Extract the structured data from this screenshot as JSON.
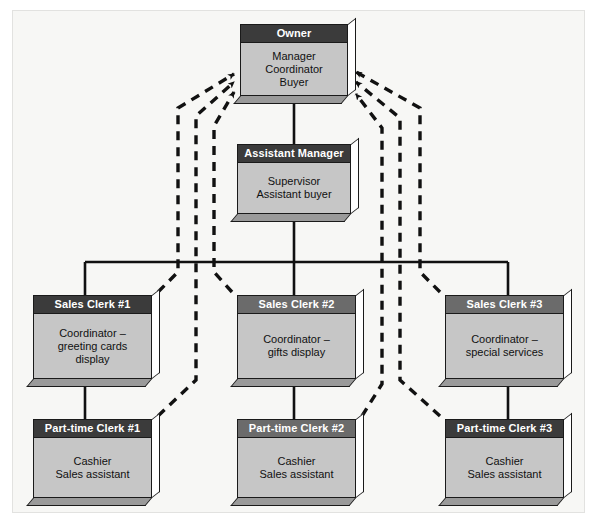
{
  "diagram": {
    "type": "organizational-chart",
    "solid_line_meaning": "direct reporting line",
    "dashed_line_meaning": "dashed arrows pointing to Owner",
    "colors": {
      "page_background": "#ffffff",
      "frame_background": "#f7f7f5",
      "frame_border": "#e2e2e0",
      "box_fill": "#c6c6c6",
      "box_outline": "#1a1a1a",
      "title_dark": "#3b3b3b",
      "title_mid": "#6b6b6b",
      "title_text": "#ffffff",
      "body_text": "#111111",
      "connector": "#111111",
      "shadow_bottom": "#9a9a9a",
      "shadow_side": "#ffffff"
    },
    "nodes": [
      {
        "id": "owner",
        "title": "Owner",
        "desc": "Manager\nCoordinator\nBuyer"
      },
      {
        "id": "assistant-manager",
        "title": "Assistant Manager",
        "desc": "Supervisor\nAssistant buyer"
      },
      {
        "id": "sales-clerk-1",
        "title": "Sales Clerk #1",
        "desc": "Coordinator –\ngreeting cards\ndisplay"
      },
      {
        "id": "sales-clerk-2",
        "title": "Sales Clerk #2",
        "desc": "Coordinator –\ngifts display"
      },
      {
        "id": "sales-clerk-3",
        "title": "Sales Clerk #3",
        "desc": "Coordinator –\nspecial services"
      },
      {
        "id": "part-time-clerk-1",
        "title": "Part-time Clerk #1",
        "desc": "Cashier\nSales assistant"
      },
      {
        "id": "part-time-clerk-2",
        "title": "Part-time Clerk #2",
        "desc": "Cashier\nSales assistant"
      },
      {
        "id": "part-time-clerk-3",
        "title": "Cashier\nSales assistant"
      }
    ],
    "nodes_by_id": {
      "owner": {
        "title": "Owner",
        "desc": "Manager\nCoordinator\nBuyer"
      },
      "assistant_manager": {
        "title": "Assistant Manager",
        "desc": "Supervisor\nAssistant buyer"
      },
      "sales_clerk_1": {
        "title": "Sales Clerk #1",
        "desc": "Coordinator –\ngreeting cards\ndisplay"
      },
      "sales_clerk_2": {
        "title": "Sales Clerk #2",
        "desc": "Coordinator –\ngifts display"
      },
      "sales_clerk_3": {
        "title": "Sales Clerk #3",
        "desc": "Coordinator –\nspecial services"
      },
      "part_time_clerk_1": {
        "title": "Part-time Clerk #1",
        "desc": "Cashier\nSales assistant"
      },
      "part_time_clerk_2": {
        "title": "Part-time Clerk #2",
        "desc": "Cashier\nSales assistant"
      },
      "part_time_clerk_3": {
        "title": "Part-time Clerk #3",
        "desc": "Cashier\nSales assistant"
      }
    },
    "solid_connections": [
      {
        "from": "owner",
        "to": "assistant_manager"
      },
      {
        "from": "assistant_manager",
        "to": "horizontal-bus"
      },
      {
        "from": "horizontal-bus",
        "to": "sales_clerk_1"
      },
      {
        "from": "horizontal-bus",
        "to": "sales_clerk_2"
      },
      {
        "from": "horizontal-bus",
        "to": "sales_clerk_3"
      },
      {
        "from": "sales_clerk_1",
        "to": "part_time_clerk_1"
      },
      {
        "from": "sales_clerk_2",
        "to": "part_time_clerk_2"
      },
      {
        "from": "sales_clerk_3",
        "to": "part_time_clerk_3"
      }
    ],
    "dashed_connections": [
      {
        "from": "sales_clerk_1",
        "to": "owner"
      },
      {
        "from": "sales_clerk_2",
        "to": "owner"
      },
      {
        "from": "sales_clerk_3",
        "to": "owner"
      },
      {
        "from": "part_time_clerk_1",
        "to": "owner"
      },
      {
        "from": "part_time_clerk_2",
        "to": "owner"
      },
      {
        "from": "part_time_clerk_3",
        "to": "owner"
      }
    ]
  }
}
